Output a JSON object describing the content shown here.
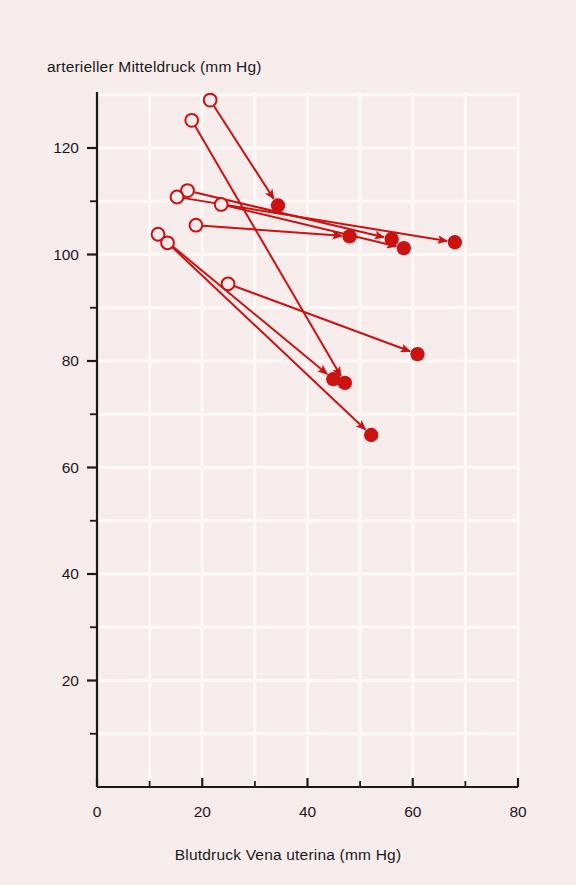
{
  "figure": {
    "kind": "scatter-vector-plot",
    "background_color": "#f7ecec",
    "grid_color": "#fdf8f8",
    "data_color": "#cc1111",
    "axis_color": "#1a1a1a"
  },
  "chart_data": {
    "type": "scatter",
    "title": "",
    "xlabel": "Blutdruck Vena uterina (mm Hg)",
    "ylabel": "arterieller Mitteldruck (mm Hg)",
    "xlim": [
      0,
      80
    ],
    "ylim": [
      0,
      132
    ],
    "x_major_ticks": [
      0,
      20,
      40,
      60,
      80
    ],
    "x_minor_ticks": [
      10,
      30,
      50,
      70
    ],
    "y_major_ticks": [
      20,
      40,
      60,
      80,
      100,
      120
    ],
    "y_minor_ticks": [
      10,
      30,
      50,
      70,
      90,
      110
    ],
    "x_tick_labels": [
      "0",
      "20",
      "40",
      "60",
      "80"
    ],
    "y_tick_labels": [
      "20",
      "40",
      "60",
      "80",
      "100",
      "120"
    ],
    "grid": true,
    "legend": null,
    "series": [
      {
        "name": "Kontrolle (offene Kreise)",
        "marker": "open-circle",
        "values": [
          {
            "x": 21.5,
            "y": 129.0
          },
          {
            "x": 18.0,
            "y": 125.2
          },
          {
            "x": 17.2,
            "y": 112.0
          },
          {
            "x": 15.2,
            "y": 110.8
          },
          {
            "x": 23.6,
            "y": 109.4
          },
          {
            "x": 18.8,
            "y": 105.5
          },
          {
            "x": 11.6,
            "y": 103.8
          },
          {
            "x": 13.4,
            "y": 102.2
          },
          {
            "x": 24.9,
            "y": 94.5
          }
        ]
      },
      {
        "name": "nach Intervention (volle Kreise)",
        "marker": "filled-circle",
        "values": [
          {
            "x": 34.4,
            "y": 109.2
          },
          {
            "x": 48.0,
            "y": 103.4
          },
          {
            "x": 56.0,
            "y": 102.9
          },
          {
            "x": 58.3,
            "y": 101.2
          },
          {
            "x": 68.0,
            "y": 102.3
          },
          {
            "x": 60.9,
            "y": 81.3
          },
          {
            "x": 44.9,
            "y": 76.6
          },
          {
            "x": 47.1,
            "y": 75.9
          },
          {
            "x": 52.1,
            "y": 66.1
          }
        ]
      }
    ],
    "vectors": [
      {
        "label": "v1",
        "x0": 21.5,
        "y0": 129.0,
        "x1": 34.4,
        "y1": 109.2
      },
      {
        "label": "v2",
        "x0": 18.0,
        "y0": 125.2,
        "x1": 47.1,
        "y1": 75.9
      },
      {
        "label": "v3",
        "x0": 17.2,
        "y0": 112.0,
        "x1": 56.0,
        "y1": 102.9
      },
      {
        "label": "v4",
        "x0": 15.2,
        "y0": 110.8,
        "x1": 68.0,
        "y1": 102.3
      },
      {
        "label": "v5",
        "x0": 23.6,
        "y0": 109.4,
        "x1": 58.3,
        "y1": 101.2
      },
      {
        "label": "v6",
        "x0": 18.8,
        "y0": 105.5,
        "x1": 48.0,
        "y1": 103.4
      },
      {
        "label": "v7",
        "x0": 11.6,
        "y0": 103.8,
        "x1": 44.9,
        "y1": 76.6
      },
      {
        "label": "v8",
        "x0": 13.4,
        "y0": 102.2,
        "x1": 52.1,
        "y1": 66.1
      },
      {
        "label": "v9",
        "x0": 24.9,
        "y0": 94.5,
        "x1": 60.9,
        "y1": 81.3
      }
    ]
  }
}
